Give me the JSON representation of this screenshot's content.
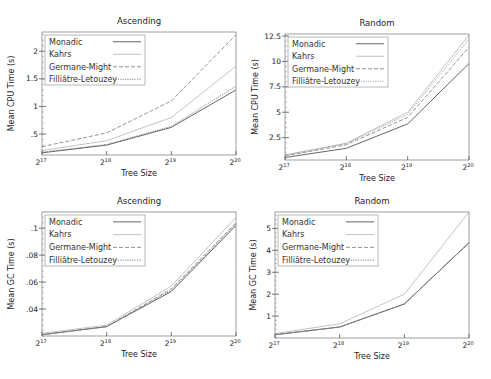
{
  "chart_data": [
    {
      "id": "cpu-ascending",
      "type": "line",
      "title": "Ascending",
      "xlabel": "Tree Size",
      "ylabel": "Mean CPU Time (s)",
      "categories": [
        "2^17",
        "2^18",
        "2^19",
        "2^20"
      ],
      "x_tick_labels": [
        {
          "base": "2",
          "exp": "17"
        },
        {
          "base": "2",
          "exp": "18"
        },
        {
          "base": "2",
          "exp": "19"
        },
        {
          "base": "2",
          "exp": "20"
        }
      ],
      "y_ticks": [
        {
          "value": 0.5,
          "label": ".5"
        },
        {
          "value": 1,
          "label": "1"
        },
        {
          "value": 1.5,
          "label": "1.5"
        },
        {
          "value": 2,
          "label": "2"
        }
      ],
      "ylim": [
        0.12,
        2.35
      ],
      "grid": false,
      "legend_position": "upper left",
      "series": [
        {
          "name": "Monadic",
          "values": [
            0.16,
            0.3,
            0.62,
            1.3
          ],
          "style": "solid",
          "color": "#555555"
        },
        {
          "name": "Kahrs",
          "values": [
            0.2,
            0.38,
            0.8,
            1.73
          ],
          "style": "solid",
          "color": "#bbbbbb"
        },
        {
          "name": "Germane-Might",
          "values": [
            0.27,
            0.52,
            1.1,
            2.3
          ],
          "style": "dashed",
          "color": "#888888"
        },
        {
          "name": "Filliâtre-Letouzey",
          "values": [
            0.17,
            0.31,
            0.64,
            1.37
          ],
          "style": "dotted",
          "color": "#777777"
        }
      ]
    },
    {
      "id": "cpu-random",
      "type": "line",
      "title": "Random",
      "xlabel": "Tree Size",
      "ylabel": "Mean CPU Time (s)",
      "categories": [
        "2^17",
        "2^18",
        "2^19",
        "2^20"
      ],
      "x_tick_labels": [
        {
          "base": "2",
          "exp": "17"
        },
        {
          "base": "2",
          "exp": "18"
        },
        {
          "base": "2",
          "exp": "19"
        },
        {
          "base": "2",
          "exp": "20"
        }
      ],
      "y_ticks": [
        {
          "value": 2.5,
          "label": "2.5"
        },
        {
          "value": 5,
          "label": "5"
        },
        {
          "value": 7.5,
          "label": "7.5"
        },
        {
          "value": 10,
          "label": "10"
        },
        {
          "value": 12.5,
          "label": "12.5"
        }
      ],
      "ylim": [
        0.3,
        12.7
      ],
      "grid": false,
      "legend_position": "upper left",
      "series": [
        {
          "name": "Monadic",
          "values": [
            0.55,
            1.45,
            3.85,
            9.8
          ],
          "style": "solid",
          "color": "#555555"
        },
        {
          "name": "Kahrs",
          "values": [
            0.8,
            1.95,
            5.0,
            12.6
          ],
          "style": "solid",
          "color": "#bbbbbb"
        },
        {
          "name": "Germane-Might",
          "values": [
            0.7,
            1.8,
            4.5,
            11.4
          ],
          "style": "dashed",
          "color": "#888888"
        },
        {
          "name": "Filliâtre-Letouzey",
          "values": [
            0.75,
            1.9,
            4.8,
            12.2
          ],
          "style": "dotted",
          "color": "#999999"
        }
      ]
    },
    {
      "id": "gc-ascending",
      "type": "line",
      "title": "Ascending",
      "xlabel": "Tree Size",
      "ylabel": "Mean GC Time (s)",
      "categories": [
        "2^17",
        "2^18",
        "2^19",
        "2^20"
      ],
      "x_tick_labels": [
        {
          "base": "2",
          "exp": "17"
        },
        {
          "base": "2",
          "exp": "18"
        },
        {
          "base": "2",
          "exp": "19"
        },
        {
          "base": "2",
          "exp": "20"
        }
      ],
      "y_ticks": [
        {
          "value": 0.04,
          "label": ".04"
        },
        {
          "value": 0.06,
          "label": ".06"
        },
        {
          "value": 0.08,
          "label": ".08"
        },
        {
          "value": 0.1,
          "label": ".1"
        }
      ],
      "ylim": [
        0.02,
        0.112
      ],
      "grid": false,
      "legend_position": "upper left",
      "series": [
        {
          "name": "Monadic",
          "values": [
            0.021,
            0.027,
            0.053,
            0.102
          ],
          "style": "solid",
          "color": "#555555"
        },
        {
          "name": "Kahrs",
          "values": [
            0.022,
            0.028,
            0.057,
            0.108
          ],
          "style": "solid",
          "color": "#bbbbbb"
        },
        {
          "name": "Germane-Might",
          "values": [
            0.021,
            0.027,
            0.055,
            0.104
          ],
          "style": "dashed",
          "color": "#888888"
        },
        {
          "name": "Filliâtre-Letouzey",
          "values": [
            0.021,
            0.027,
            0.054,
            0.103
          ],
          "style": "dotted",
          "color": "#777777"
        }
      ]
    },
    {
      "id": "gc-random",
      "type": "line",
      "title": "Random",
      "xlabel": "Tree Size",
      "ylabel": "Mean GC Time (s)",
      "categories": [
        "2^17",
        "2^18",
        "2^19",
        "2^20"
      ],
      "x_tick_labels": [
        {
          "base": "2",
          "exp": "17"
        },
        {
          "base": "2",
          "exp": "18"
        },
        {
          "base": "2",
          "exp": "19"
        },
        {
          "base": "2",
          "exp": "20"
        }
      ],
      "y_ticks": [
        {
          "value": 1,
          "label": "1"
        },
        {
          "value": 2,
          "label": "2"
        },
        {
          "value": 3,
          "label": "3"
        },
        {
          "value": 4,
          "label": "4"
        },
        {
          "value": 5,
          "label": "5"
        }
      ],
      "ylim": [
        0.0,
        5.75
      ],
      "grid": false,
      "legend_position": "upper left",
      "series": [
        {
          "name": "Monadic",
          "values": [
            0.15,
            0.5,
            1.55,
            4.35
          ],
          "style": "solid",
          "color": "#555555"
        },
        {
          "name": "Kahrs",
          "values": [
            0.2,
            0.65,
            2.0,
            5.75
          ],
          "style": "solid",
          "color": "#bbbbbb"
        },
        {
          "name": "Germane-Might",
          "values": [
            0.15,
            0.5,
            1.55,
            4.35
          ],
          "style": "dashed",
          "color": "#888888"
        },
        {
          "name": "Filliâtre-Letouzey",
          "values": [
            0.15,
            0.5,
            1.55,
            4.35
          ],
          "style": "dotted",
          "color": "#777777"
        }
      ]
    }
  ],
  "layout": {
    "panels": [
      {
        "frame": [
          42,
          32,
          236,
          155
        ],
        "title_y": 24,
        "ylabel_x": 14,
        "legend": [
          45,
          35,
          145,
          85
        ]
      },
      {
        "frame": [
          285,
          34,
          469,
          160
        ],
        "title_y": 26,
        "ylabel_x": 258,
        "legend": [
          288,
          37,
          388,
          87
        ]
      },
      {
        "frame": [
          42,
          212,
          236,
          336
        ],
        "title_y": 204,
        "ylabel_x": 14,
        "legend": [
          45,
          215,
          145,
          266
        ]
      },
      {
        "frame": [
          275,
          212,
          469,
          338
        ],
        "title_y": 204,
        "ylabel_x": 256,
        "legend": [
          278,
          215,
          378,
          266
        ]
      }
    ]
  }
}
